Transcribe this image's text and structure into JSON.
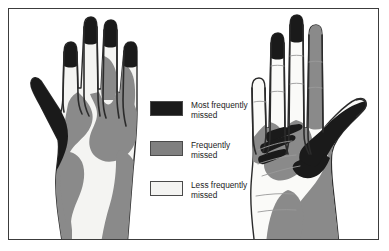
{
  "figure": {
    "border_color": "#3c3c3c",
    "background_color": "#ffffff"
  },
  "legend": {
    "items": [
      {
        "label_line1": "Most frequently",
        "label_line2": "missed",
        "color": "#1a1a1a",
        "swatch_name": "most-frequently-missed-swatch"
      },
      {
        "label_line1": "Frequently",
        "label_line2": "missed",
        "color": "#808080",
        "swatch_name": "frequently-missed-swatch"
      },
      {
        "label_line1": "Less frequently",
        "label_line2": "missed",
        "color": "#f4f4f2",
        "swatch_name": "less-frequently-missed-swatch"
      }
    ]
  },
  "hands": {
    "left": {
      "name": "Dorsal view of hand",
      "view": "dorsal",
      "outline_color": "#2b2b2b",
      "fill_light": "#f4f4f2",
      "fill_mid": "#8a8a8a",
      "fill_dark": "#1a1a1a"
    },
    "right": {
      "name": "Palmar view of hand",
      "view": "palmar",
      "outline_color": "#2b2b2b",
      "fill_light": "#fafaf8",
      "fill_mid": "#8a8a8a",
      "fill_dark": "#1a1a1a"
    }
  }
}
